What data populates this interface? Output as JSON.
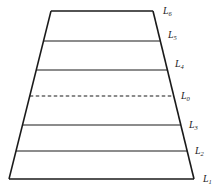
{
  "diagram": {
    "type": "layered-trapezoid",
    "stroke_color": "#1a1a1a",
    "levels": [
      {
        "id": "L6",
        "letter": "L",
        "sub": "6",
        "style": "solid",
        "role": "top-edge"
      },
      {
        "id": "L5",
        "letter": "L",
        "sub": "5",
        "style": "solid",
        "role": "divider"
      },
      {
        "id": "L4",
        "letter": "L",
        "sub": "4",
        "style": "solid",
        "role": "divider"
      },
      {
        "id": "L0",
        "letter": "L",
        "sub": "0",
        "style": "dashed",
        "role": "reference"
      },
      {
        "id": "L3",
        "letter": "L",
        "sub": "3",
        "style": "solid",
        "role": "divider"
      },
      {
        "id": "L2",
        "letter": "L",
        "sub": "2",
        "style": "solid",
        "role": "divider"
      },
      {
        "id": "L1",
        "letter": "L",
        "sub": "1",
        "style": "solid",
        "role": "bottom-edge"
      }
    ]
  }
}
